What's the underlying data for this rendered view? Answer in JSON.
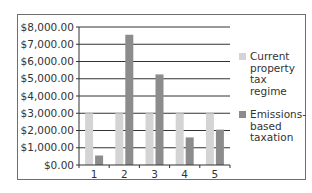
{
  "chart_data": {
    "type": "bar",
    "title": "",
    "xlabel": "",
    "ylabel": "",
    "categories": [
      "1",
      "2",
      "3",
      "4",
      "5"
    ],
    "ylim": [
      0,
      8000
    ],
    "yticks": [
      0,
      1000,
      2000,
      3000,
      4000,
      5000,
      6000,
      7000,
      8000
    ],
    "ytick_labels": [
      "$0.00",
      "$1,000.00",
      "$2,000.00",
      "$3,000.00",
      "$4,000.00",
      "$5,000.00",
      "$6,000.00",
      "$7,000.00",
      "$8,000.00"
    ],
    "grid": true,
    "legend_position": "right",
    "series": [
      {
        "name": "Current property tax regime",
        "legend_lines": [
          "Current",
          "property",
          "tax",
          "regime"
        ],
        "color": "#d4d4d4",
        "values": [
          3000,
          3000,
          3000,
          3000,
          3000
        ]
      },
      {
        "name": "Emissions-based taxation",
        "legend_lines": [
          "Emissions-",
          "based",
          "taxation"
        ],
        "color": "#8c8c8c",
        "values": [
          550,
          7550,
          5250,
          1600,
          2050
        ]
      }
    ]
  }
}
